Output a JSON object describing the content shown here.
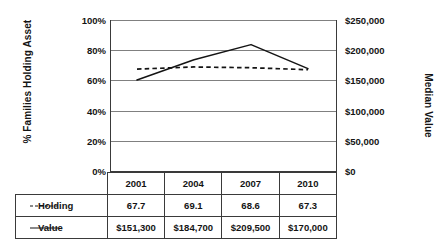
{
  "chart_data": {
    "type": "line",
    "title": "",
    "xlabel": "",
    "ylabel": "% Families Holding Asset",
    "ylabel_secondary": "Median Value",
    "categories": [
      "2001",
      "2004",
      "2007",
      "2010"
    ],
    "grid": true,
    "legend_position": "table-row-labels",
    "series": [
      {
        "name": "Holding",
        "axis": "left",
        "style": "dashed",
        "color": "#141414",
        "values": [
          67.7,
          69.1,
          68.6,
          67.3
        ],
        "display_values": [
          "67.7",
          "69.1",
          "68.6",
          "67.3"
        ]
      },
      {
        "name": "Value",
        "axis": "right",
        "style": "solid",
        "color": "#141414",
        "values": [
          151300,
          184700,
          209500,
          170000
        ],
        "display_values": [
          "$151,300",
          "$184,700",
          "$209,500",
          "$170,000"
        ]
      }
    ],
    "left_axis": {
      "label": "% Families Holding Asset",
      "min": 0,
      "max": 100,
      "ticks": [
        0,
        20,
        40,
        60,
        80,
        100
      ],
      "tick_labels": [
        "0%",
        "20%",
        "40%",
        "60%",
        "80%",
        "100%"
      ]
    },
    "right_axis": {
      "label": "Median Value",
      "min": 0,
      "max": 250000,
      "ticks": [
        0,
        50000,
        100000,
        150000,
        200000,
        250000
      ],
      "tick_labels": [
        "$0",
        "$50,000",
        "$100,000",
        "$150,000",
        "$200,000",
        "$250,000"
      ]
    }
  },
  "table": {
    "header_corner": "",
    "columns": [
      "2001",
      "2004",
      "2007",
      "2010"
    ],
    "rows": [
      {
        "label": "Holding",
        "marker": "dashed-line-marker",
        "cells": [
          "67.7",
          "69.1",
          "68.6",
          "67.3"
        ]
      },
      {
        "label": "Value",
        "marker": "solid-line-marker",
        "cells": [
          "$151,300",
          "$184,700",
          "$209,500",
          "$170,000"
        ]
      }
    ]
  },
  "ticks": {
    "left": [
      "100%",
      "80%",
      "60%",
      "40%",
      "20%",
      "0%"
    ],
    "right": [
      "$250,000",
      "$200,000",
      "$150,000",
      "$100,000",
      "$50,000",
      "$0"
    ]
  },
  "colors": {
    "series": "#141414",
    "gridline": "#808080",
    "border": "#3a3a3a",
    "background": "#ffffff"
  }
}
